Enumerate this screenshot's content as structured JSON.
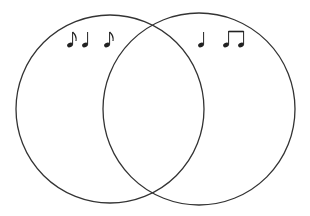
{
  "diagram": {
    "type": "venn",
    "sets": [
      {
        "name": "left-set",
        "notes": [
          "eighth-note",
          "quarter-note",
          "eighth-note"
        ]
      },
      {
        "name": "right-set",
        "notes": [
          "quarter-note",
          "beamed-eighth-notes"
        ]
      }
    ],
    "intersection": [],
    "colors": {
      "stroke": "#333333",
      "background": "#ffffff"
    }
  }
}
